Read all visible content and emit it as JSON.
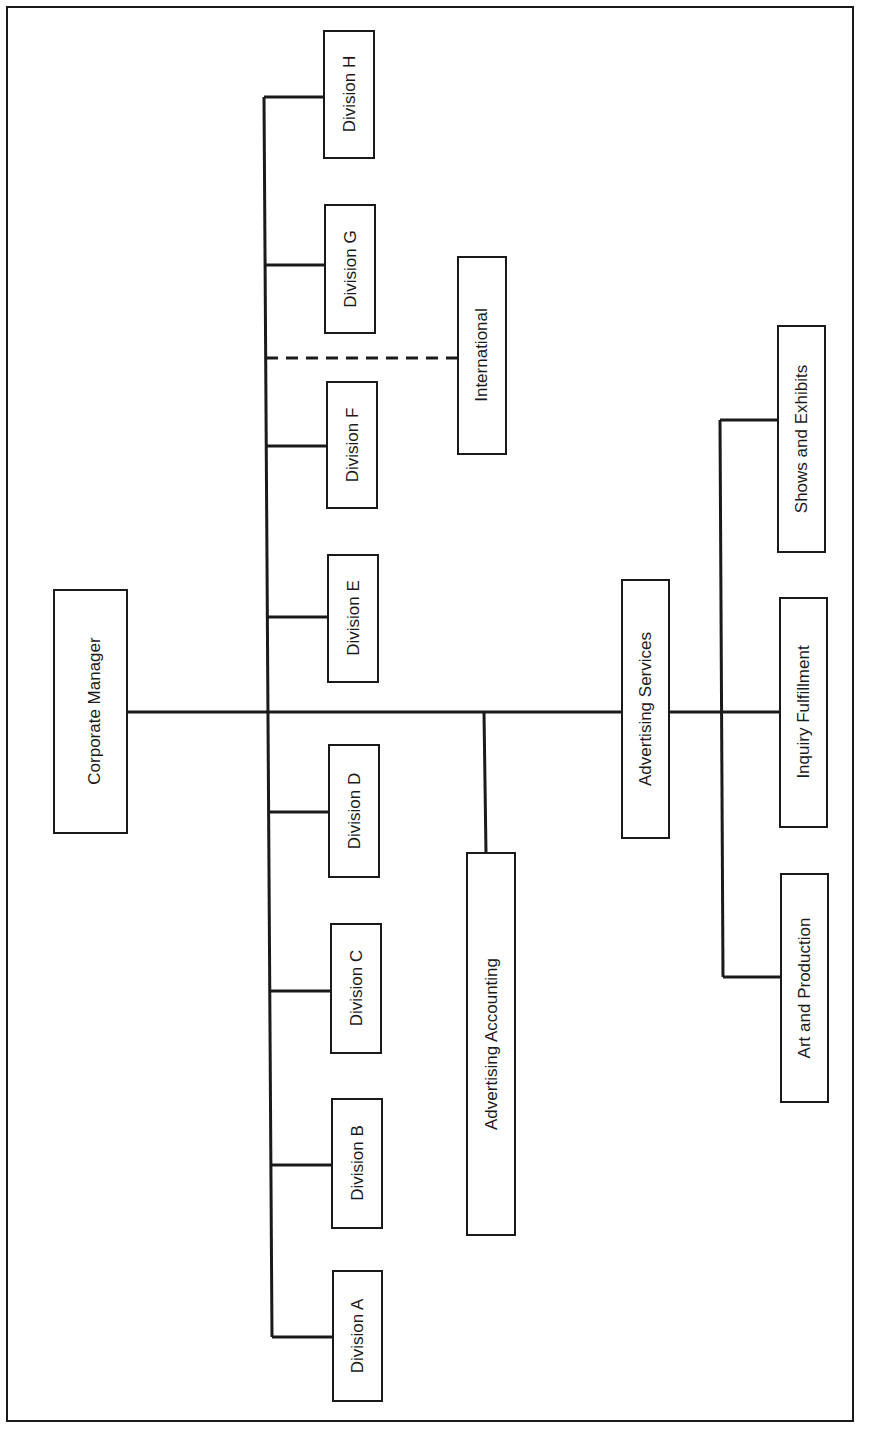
{
  "diagram": {
    "type": "org-chart",
    "orientation": "rotated-90-ccw",
    "colors": {
      "line": "#1a1a1a",
      "box_border": "#1a1a1a",
      "background": "#ffffff",
      "text": "#1a1a1a"
    },
    "root": {
      "label": "Corporate Manager"
    },
    "divisions": [
      {
        "label": "Division A"
      },
      {
        "label": "Division B"
      },
      {
        "label": "Division C"
      },
      {
        "label": "Division D"
      },
      {
        "label": "Division E"
      },
      {
        "label": "Division F"
      },
      {
        "label": "Division G"
      },
      {
        "label": "Division H"
      }
    ],
    "dotted_line_unit": {
      "label": "International",
      "connection": "dashed"
    },
    "staff_units": [
      {
        "label": "Advertising Accounting"
      },
      {
        "label": "Advertising Services"
      }
    ],
    "advertising_services_children": [
      {
        "label": "Art and Production"
      },
      {
        "label": "Inquiry Fulfillment"
      },
      {
        "label": "Shows and Exhibits"
      }
    ]
  }
}
